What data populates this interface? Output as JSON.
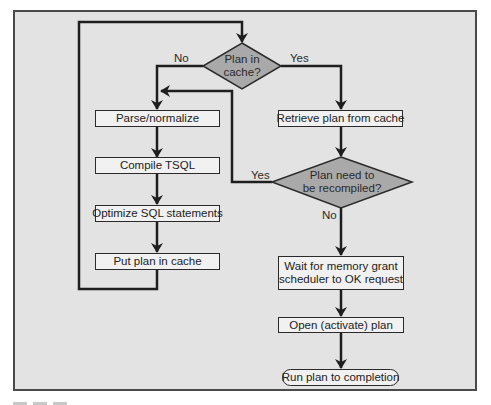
{
  "diagram": {
    "type": "flowchart",
    "colors": {
      "background": "#e3e3e3",
      "frame_border": "#4a4a4a",
      "box_fill": "#f1f1f1",
      "decision_fill": "#a9a9a9",
      "line": "#1e1e1e"
    },
    "nodes": {
      "plan_in_cache": {
        "shape": "decision",
        "line1": "Plan in",
        "line2": "cache?"
      },
      "parse": {
        "shape": "process",
        "label": "Parse/normalize"
      },
      "compile": {
        "shape": "process",
        "label": "Compile TSQL"
      },
      "optimize": {
        "shape": "process",
        "label": "Optimize SQL statements"
      },
      "put_cache": {
        "shape": "process",
        "label": "Put plan in cache"
      },
      "retrieve": {
        "shape": "process",
        "label": "Retrieve plan from cache"
      },
      "recompile": {
        "shape": "decision",
        "line1": "Plan need to",
        "line2": "be recompiled?"
      },
      "wait": {
        "shape": "process",
        "line1": "Wait for memory grant",
        "line2": "scheduler to OK request"
      },
      "open": {
        "shape": "process",
        "label": "Open (activate) plan"
      },
      "run": {
        "shape": "terminator",
        "label": "Run plan to completion"
      }
    },
    "edge_labels": {
      "cache_no": "No",
      "cache_yes": "Yes",
      "recompile_yes": "Yes",
      "recompile_no": "No"
    },
    "edges": [
      {
        "from": "plan_in_cache",
        "to": "parse",
        "label": "No"
      },
      {
        "from": "plan_in_cache",
        "to": "retrieve",
        "label": "Yes"
      },
      {
        "from": "parse",
        "to": "compile"
      },
      {
        "from": "compile",
        "to": "optimize"
      },
      {
        "from": "optimize",
        "to": "put_cache"
      },
      {
        "from": "put_cache",
        "to": "plan_in_cache"
      },
      {
        "from": "retrieve",
        "to": "recompile"
      },
      {
        "from": "recompile",
        "to": "parse",
        "label": "Yes"
      },
      {
        "from": "recompile",
        "to": "wait",
        "label": "No"
      },
      {
        "from": "wait",
        "to": "open"
      },
      {
        "from": "open",
        "to": "run"
      }
    ]
  }
}
